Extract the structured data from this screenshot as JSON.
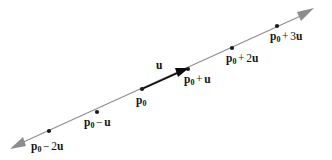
{
  "figure": {
    "kind": "vector-line-diagram",
    "background_color": "#ffffff",
    "line_color": "#8d8d8d",
    "vector_color": "#0b0b0b",
    "point_color": "#1a1a1a",
    "line": {
      "start": [
        12,
        148
      ],
      "end": [
        312,
        10
      ],
      "double_headed": true
    },
    "points": [
      {
        "id": "p0-minus-2u",
        "x": 49,
        "y": 131
      },
      {
        "id": "p0-minus-u",
        "x": 97,
        "y": 112
      },
      {
        "id": "p0",
        "x": 142,
        "y": 89
      },
      {
        "id": "p0-plus-u",
        "x": 188,
        "y": 69
      },
      {
        "id": "p0-plus-2u",
        "x": 232,
        "y": 48
      },
      {
        "id": "p0-plus-3u",
        "x": 277,
        "y": 26
      }
    ],
    "vector": {
      "label": "u",
      "from": "p0",
      "to": "p0-plus-u",
      "label_x": 156,
      "label_y": 60
    },
    "labels": {
      "p0_minus_2u": {
        "base": "p",
        "sub": "0",
        "op": "−",
        "coef": "2",
        "vec": "u",
        "x": 31,
        "y": 141
      },
      "p0_minus_u": {
        "base": "p",
        "sub": "0",
        "op": "−",
        "coef": "",
        "vec": "u",
        "x": 84,
        "y": 117
      },
      "p0": {
        "base": "p",
        "sub": "0",
        "op": "",
        "coef": "",
        "vec": "",
        "x": 136,
        "y": 95
      },
      "p0_plus_u": {
        "base": "p",
        "sub": "0",
        "op": "+",
        "coef": "",
        "vec": "u",
        "x": 184,
        "y": 74
      },
      "p0_plus_2u": {
        "base": "p",
        "sub": "0",
        "op": "+",
        "coef": "2",
        "vec": "u",
        "x": 226,
        "y": 53
      },
      "p0_plus_3u": {
        "base": "p",
        "sub": "0",
        "op": "+",
        "coef": "3",
        "vec": "u",
        "x": 270,
        "y": 31
      }
    }
  }
}
